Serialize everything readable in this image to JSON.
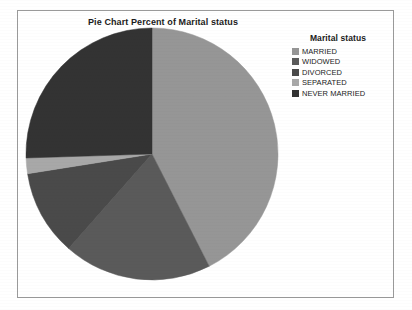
{
  "chart": {
    "title": "Pie Chart Percent of Marital status",
    "frame_border_color": "#9a9a9a",
    "background_color": "#ffffff"
  },
  "legend": {
    "title": "Marital status",
    "position": "top-right",
    "entries": [
      {
        "label": "MARRIED",
        "color": "#969696"
      },
      {
        "label": "WIDOWED",
        "color": "#5a5a5a"
      },
      {
        "label": "DIVORCED",
        "color": "#4a4a4a"
      },
      {
        "label": "SEPARATED",
        "color": "#a8a8a8"
      },
      {
        "label": "NEVER MARRIED",
        "color": "#333333"
      }
    ]
  },
  "chart_data": {
    "type": "pie",
    "title": "Pie Chart Percent of Marital status",
    "xlabel": "",
    "ylabel": "",
    "legend_title": "Marital status",
    "legend_position": "top-right",
    "start_angle_deg": 0,
    "direction": "clockwise",
    "labels": [
      "MARRIED",
      "WIDOWED",
      "DIVORCED",
      "SEPARATED",
      "NEVER MARRIED"
    ],
    "values": [
      42.5,
      19.0,
      11.0,
      2.0,
      25.5
    ],
    "colors": [
      "#969696",
      "#5a5a5a",
      "#4a4a4a",
      "#a8a8a8",
      "#333333"
    ],
    "slices": [
      {
        "label": "MARRIED",
        "value": 42.5,
        "color": "#969696",
        "start_deg": 0.0,
        "end_deg": 153.0
      },
      {
        "label": "WIDOWED",
        "value": 19.0,
        "color": "#5a5a5a",
        "start_deg": 153.0,
        "end_deg": 221.4
      },
      {
        "label": "DIVORCED",
        "value": 11.0,
        "color": "#4a4a4a",
        "start_deg": 221.4,
        "end_deg": 261.0
      },
      {
        "label": "SEPARATED",
        "value": 2.0,
        "color": "#a8a8a8",
        "start_deg": 261.0,
        "end_deg": 268.2
      },
      {
        "label": "NEVER MARRIED",
        "value": 25.5,
        "color": "#333333",
        "start_deg": 268.2,
        "end_deg": 360.0
      }
    ]
  },
  "geometry": {
    "center_x": 127,
    "center_y": 127,
    "radius": 126
  }
}
